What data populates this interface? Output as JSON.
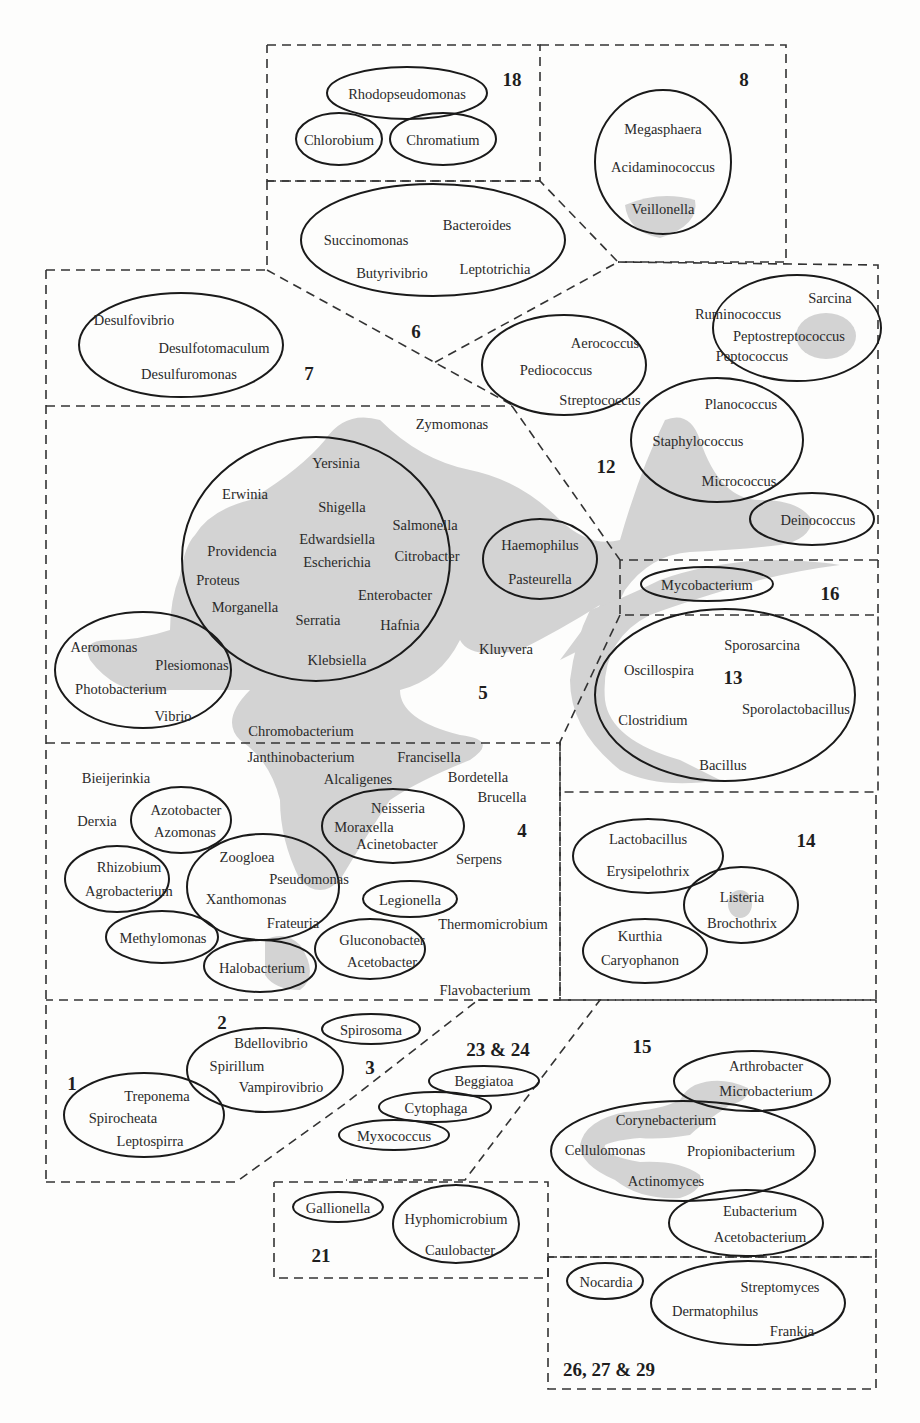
{
  "colors": {
    "outline": "#1a1a1a",
    "shading": "#d2d2d2",
    "dash": "#333333",
    "background": "#fdfdfc"
  },
  "group_numbers": {
    "g18": "18",
    "g8": "8",
    "g6": "6",
    "g7": "7",
    "g12": "12",
    "g5": "5",
    "g16": "16",
    "g13": "13",
    "g4": "4",
    "g14": "14",
    "g1": "1",
    "g2": "2",
    "g3": "3",
    "g23_24": "23 & 24",
    "g15": "15",
    "g21": "21",
    "g26_27_29": "26, 27 & 29"
  },
  "taxa": {
    "rhodopseudomonas": "Rhodopseudomonas",
    "chlorobium": "Chlorobium",
    "chromatium": "Chromatium",
    "megasphaera": "Megasphaera",
    "acidaminococcus": "Acidaminococcus",
    "veillonella": "Veillonella",
    "succinomonas": "Succinomonas",
    "bacteroides": "Bacteroides",
    "butyrivibrio": "Butyrivibrio",
    "leptotrichia": "Leptotrichia",
    "desulfovibrio": "Desulfovibrio",
    "desulfotomaculum": "Desulfotomaculum",
    "desulfuromonas": "Desulfuromonas",
    "sarcina": "Sarcina",
    "ruminococcus": "Ruminococcus",
    "peptostreptococcus": "Peptostreptococcus",
    "peptococcus": "Peptococcus",
    "aerococcus": "Aerococcus",
    "pediococcus": "Pediococcus",
    "streptococcus": "Streptococcus",
    "planococcus": "Planococcus",
    "staphylococcus": "Staphylococcus",
    "micrococcus": "Micrococcus",
    "deinococcus": "Deinococcus",
    "zymomonas": "Zymomonas",
    "yersinia": "Yersinia",
    "erwinia": "Erwinia",
    "shigella": "Shigella",
    "salmonella": "Salmonella",
    "edwardsiella": "Edwardsiella",
    "providencia": "Providencia",
    "escherichia": "Escherichia",
    "citrobacter": "Citrobacter",
    "proteus": "Proteus",
    "enterobacter": "Enterobacter",
    "morganella": "Morganella",
    "serratia": "Serratia",
    "hafnia": "Hafnia",
    "klebsiella": "Klebsiella",
    "haemophilus": "Haemophilus",
    "pasteurella": "Pasteurella",
    "kluyvera": "Kluyvera",
    "aeromonas": "Aeromonas",
    "plesiomonas": "Plesiomonas",
    "photobacterium": "Photobacterium",
    "vibrio": "Vibrio",
    "chromobacterium": "Chromobacterium",
    "mycobacterium": "Mycobacterium",
    "sporosarcina": "Sporosarcina",
    "oscillospira": "Oscillospira",
    "sporolactobacillus": "Sporolactobacillus",
    "clostridium": "Clostridium",
    "bacillus": "Bacillus",
    "janthinobacterium": "Janthinobacterium",
    "francisella": "Francisella",
    "bieijerinkia": "Bieijerinkia",
    "alcaligenes": "Alcaligenes",
    "bordetella": "Bordetella",
    "brucella": "Brucella",
    "azotobacter": "Azotobacter",
    "azomonas": "Azomonas",
    "derxia": "Derxia",
    "neisseria": "Neisseria",
    "moraxella": "Moraxella",
    "acinetobacter": "Acinetobacter",
    "serpens": "Serpens",
    "rhizobium": "Rhizobium",
    "agrobacterium": "Agrobacterium",
    "zoogloea": "Zoogloea",
    "pseudomonas": "Pseudomonas",
    "xanthomonas": "Xanthomonas",
    "frateuria": "Frateuria",
    "legionella": "Legionella",
    "thermomicrobium": "Thermomicrobium",
    "methylomonas": "Methylomonas",
    "gluconobacter": "Gluconobacter",
    "acetobacter": "Acetobacter",
    "halobacterium": "Halobacterium",
    "flavobacterium": "Flavobacterium",
    "lactobacillus": "Lactobacillus",
    "erysipelothrix": "Erysipelothrix",
    "listeria": "Listeria",
    "brochothrix": "Brochothrix",
    "kurthia": "Kurthia",
    "caryophanon": "Caryophanon",
    "bdellovibrio": "Bdellovibrio",
    "spirillum": "Spirillum",
    "vampirovibrio": "Vampirovibrio",
    "spirosoma": "Spirosoma",
    "treponema": "Treponema",
    "spirocheata": "Spirocheata",
    "leptospirra": "Leptospirra",
    "beggiatoa": "Beggiatoa",
    "cytophaga": "Cytophaga",
    "myxococcus": "Myxococcus",
    "arthrobacter": "Arthrobacter",
    "microbacterium": "Microbacterium",
    "corynebacterium": "Corynebacterium",
    "cellulomonas": "Cellulomonas",
    "propionibacterium": "Propionibacterium",
    "actinomyces": "Actinomyces",
    "eubacterium": "Eubacterium",
    "acetobacterium": "Acetobacterium",
    "gallionella": "Gallionella",
    "hyphomicrobium": "Hyphomicrobium",
    "caulobacter": "Caulobacter",
    "nocardia": "Nocardia",
    "streptomyces": "Streptomyces",
    "dermatophilus": "Dermatophilus",
    "frankia": "Frankia"
  }
}
